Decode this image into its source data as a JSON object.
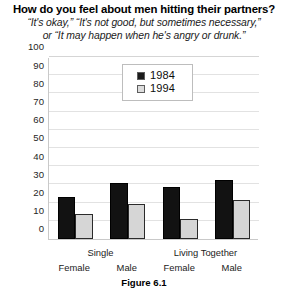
{
  "title": "How do you feel about men hitting their partners?",
  "subtitle_lines": [
    "“It's okay,” “It's not good, but sometimes necessary,”",
    "or “It may happen when he's angry or drunk.”"
  ],
  "figure_caption": "Figure 6.1",
  "colors": {
    "series_1984": "#121212",
    "series_1994": "#d6d6d6",
    "gridline": "#e2e2e2",
    "axis": "#c9c9c9",
    "text": "#000000"
  },
  "chart_data": {
    "type": "bar",
    "title": "How do you feel about men hitting their partners?",
    "subtitle": "“It's okay,” “It's not good, but sometimes necessary,” or “It may happen when he's angry or drunk.”",
    "xlabel": "",
    "ylabel": "",
    "ylim": [
      0,
      100
    ],
    "yticks": [
      0,
      10,
      20,
      30,
      40,
      50,
      60,
      70,
      80,
      90,
      100
    ],
    "ytick_labels": [
      "0",
      "10",
      "20",
      "30",
      "40",
      "50",
      "60",
      "70",
      "80",
      "90",
      "100"
    ],
    "grid": true,
    "legend_position": "upper center",
    "group_labels": [
      "Single",
      "Living Together"
    ],
    "categories": [
      "Female",
      "Male",
      "Female",
      "Male"
    ],
    "series": [
      {
        "name": "1984",
        "values": [
          23,
          31,
          28.5,
          32.5
        ]
      },
      {
        "name": "1994",
        "values": [
          14,
          19,
          11,
          21.5
        ]
      }
    ]
  }
}
